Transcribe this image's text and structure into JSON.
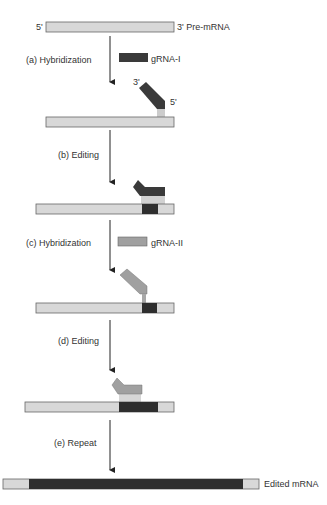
{
  "diagram": {
    "colors": {
      "mrna": "#d8d8d8",
      "edited": "#2e2e2e",
      "grna1": "#3a3a3a",
      "grna2": "#a0a0a0",
      "outline": "#555555",
      "arrow": "#222222"
    },
    "labels": {
      "five_prime": "5'",
      "three_prime_premrna": "3' Pre-mRNA",
      "step_a": "(a)  Hybridization",
      "grna1": "gRNA-I",
      "grna1_3prime": "3'",
      "grna1_5prime": "5'",
      "step_b": "(b)  Editing",
      "step_c": "(c)  Hybridization",
      "grna2": "gRNA-II",
      "step_d": "(d)  Editing",
      "step_e": "(e)  Repeat",
      "edited_mrna": "Edited mRNA"
    },
    "steps": [
      {
        "id": "a",
        "label": "Hybridization",
        "guide": "gRNA-I"
      },
      {
        "id": "b",
        "label": "Editing"
      },
      {
        "id": "c",
        "label": "Hybridization",
        "guide": "gRNA-II"
      },
      {
        "id": "d",
        "label": "Editing"
      },
      {
        "id": "e",
        "label": "Repeat"
      }
    ]
  }
}
